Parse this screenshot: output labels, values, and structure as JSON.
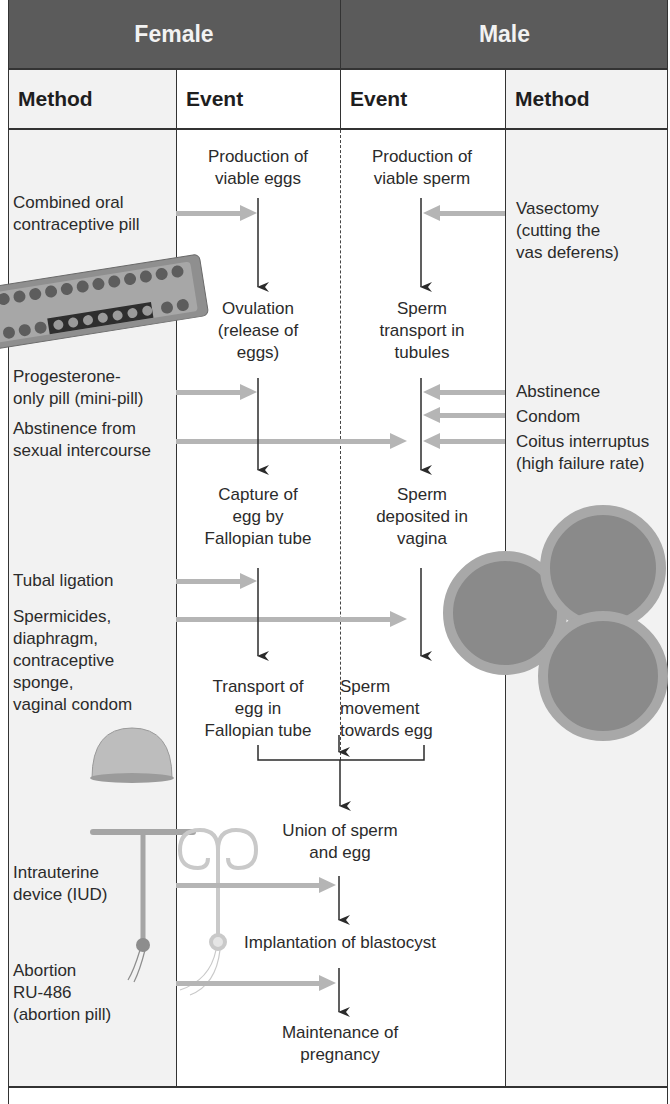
{
  "header": {
    "female": "Female",
    "male": "Male"
  },
  "subheader": {
    "female_method": "Method",
    "female_event": "Event",
    "male_event": "Event",
    "male_method": "Method"
  },
  "female_events": [
    {
      "line1": "Production of",
      "line2": "viable eggs",
      "line3": ""
    },
    {
      "line1": "Ovulation",
      "line2": "(release of",
      "line3": "eggs)"
    },
    {
      "line1": "Capture of",
      "line2": "egg by",
      "line3": "Fallopian tube"
    },
    {
      "line1": "Transport of",
      "line2": "egg in",
      "line3": "Fallopian tube"
    }
  ],
  "male_events": [
    {
      "line1": "Production of",
      "line2": "viable sperm",
      "line3": ""
    },
    {
      "line1": "Sperm",
      "line2": "transport in",
      "line3": "tubules"
    },
    {
      "line1": "Sperm",
      "line2": "deposited in",
      "line3": "vagina"
    },
    {
      "line1": "Sperm",
      "line2": "movement",
      "line3": "towards egg"
    }
  ],
  "shared_events": [
    {
      "line1": "Union of sperm",
      "line2": "and egg"
    },
    {
      "line1": "Implantation of blastocyst",
      "line2": ""
    },
    {
      "line1": "Maintenance of",
      "line2": "pregnancy"
    }
  ],
  "female_methods": {
    "combined_pill": [
      "Combined oral",
      "contraceptive pill"
    ],
    "mini_pill": [
      "Progesterone-",
      "only pill (mini-pill)"
    ],
    "abstinence": [
      "Abstinence from",
      "sexual intercourse"
    ],
    "tubal_ligation": [
      "Tubal ligation"
    ],
    "barrier": [
      "Spermicides,",
      "diaphragm,",
      "contraceptive",
      "sponge,",
      "vaginal condom"
    ],
    "iud": [
      "Intrauterine",
      "device (IUD)"
    ],
    "abortion": [
      "Abortion",
      "RU-486",
      "(abortion pill)"
    ]
  },
  "male_methods": {
    "vasectomy": [
      "Vasectomy",
      "(cutting the",
      "vas deferens)"
    ],
    "abstinence": "Abstinence",
    "condom": "Condom",
    "coitus": [
      "Coitus interruptus",
      "(high failure rate)"
    ]
  },
  "illustrations": {
    "pill_pack": "pill-pack-image",
    "diaphragm": "diaphragm-image",
    "condoms": "condoms-image",
    "t_iud": "t-shaped-iud-image",
    "spiral_iud": "spiral-iud-image"
  },
  "colors": {
    "header_bg": "#5b5b5b",
    "method_bg": "#f2f2f2",
    "block_arrow": "#b5b5b5",
    "flow_arrow": "#2b2b2b"
  }
}
